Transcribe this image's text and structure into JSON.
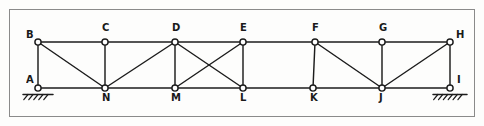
{
  "diagram": {
    "kind": "truss-line-diagram",
    "stroke_color": "#1c1c1c",
    "node_fill_color": "#ffffff",
    "border_color": "#8a8a8a",
    "background_color": "#fdfdfc",
    "canvas": {
      "width": 484,
      "height": 126
    },
    "border": {
      "x": 9,
      "y": 9,
      "width": 465,
      "height": 107
    },
    "chords": {
      "top_y": 42,
      "bottom_y": 88
    },
    "nodes": [
      {
        "id": "A",
        "label": "A",
        "x": 38,
        "y": 88,
        "label_dx": -12,
        "label_dy": -13,
        "support": "pin"
      },
      {
        "id": "B",
        "label": "B",
        "x": 38,
        "y": 42,
        "label_dx": -12,
        "label_dy": -12,
        "support": "none"
      },
      {
        "id": "C",
        "label": "C",
        "x": 105,
        "y": 42,
        "label_dx": -3,
        "label_dy": -19,
        "support": "none"
      },
      {
        "id": "D",
        "label": "D",
        "x": 175,
        "y": 42,
        "label_dx": -3,
        "label_dy": -19,
        "support": "none"
      },
      {
        "id": "E",
        "label": "E",
        "x": 243,
        "y": 42,
        "label_dx": -3,
        "label_dy": -19,
        "support": "none"
      },
      {
        "id": "F",
        "label": "F",
        "x": 315,
        "y": 42,
        "label_dx": -3,
        "label_dy": -19,
        "support": "none"
      },
      {
        "id": "G",
        "label": "G",
        "x": 382,
        "y": 42,
        "label_dx": -3,
        "label_dy": -19,
        "support": "none"
      },
      {
        "id": "H",
        "label": "H",
        "x": 450,
        "y": 42,
        "label_dx": 6,
        "label_dy": -12,
        "support": "none"
      },
      {
        "id": "I",
        "label": "I",
        "x": 450,
        "y": 88,
        "label_dx": 7,
        "label_dy": -13,
        "support": "pin"
      },
      {
        "id": "J",
        "label": "J",
        "x": 382,
        "y": 88,
        "label_dx": -3,
        "label_dy": 5,
        "support": "none"
      },
      {
        "id": "K",
        "label": "K",
        "x": 313,
        "y": 88,
        "label_dx": -3,
        "label_dy": 5,
        "support": "none"
      },
      {
        "id": "L",
        "label": "L",
        "x": 243,
        "y": 88,
        "label_dx": -3,
        "label_dy": 5,
        "support": "none"
      },
      {
        "id": "M",
        "label": "M",
        "x": 175,
        "y": 88,
        "label_dx": -4,
        "label_dy": 5,
        "support": "none"
      },
      {
        "id": "N",
        "label": "N",
        "x": 105,
        "y": 88,
        "label_dx": -3,
        "label_dy": 5,
        "support": "none"
      }
    ],
    "members": [
      {
        "from": "B",
        "to": "C",
        "type": "top-chord"
      },
      {
        "from": "C",
        "to": "D",
        "type": "top-chord"
      },
      {
        "from": "D",
        "to": "E",
        "type": "top-chord"
      },
      {
        "from": "E",
        "to": "F",
        "type": "top-chord"
      },
      {
        "from": "F",
        "to": "G",
        "type": "top-chord"
      },
      {
        "from": "G",
        "to": "H",
        "type": "top-chord"
      },
      {
        "from": "A",
        "to": "N",
        "type": "bottom-chord"
      },
      {
        "from": "N",
        "to": "M",
        "type": "bottom-chord"
      },
      {
        "from": "M",
        "to": "L",
        "type": "bottom-chord"
      },
      {
        "from": "L",
        "to": "K",
        "type": "bottom-chord"
      },
      {
        "from": "K",
        "to": "J",
        "type": "bottom-chord"
      },
      {
        "from": "J",
        "to": "I",
        "type": "bottom-chord"
      },
      {
        "from": "A",
        "to": "B",
        "type": "vertical"
      },
      {
        "from": "C",
        "to": "N",
        "type": "vertical"
      },
      {
        "from": "D",
        "to": "M",
        "type": "vertical"
      },
      {
        "from": "E",
        "to": "L",
        "type": "vertical"
      },
      {
        "from": "F",
        "to": "K",
        "type": "vertical"
      },
      {
        "from": "G",
        "to": "J",
        "type": "vertical"
      },
      {
        "from": "H",
        "to": "I",
        "type": "vertical"
      },
      {
        "from": "B",
        "to": "N",
        "type": "diagonal"
      },
      {
        "from": "N",
        "to": "D",
        "type": "diagonal"
      },
      {
        "from": "D",
        "to": "L",
        "type": "diagonal"
      },
      {
        "from": "E",
        "to": "M",
        "type": "diagonal"
      },
      {
        "from": "F",
        "to": "J",
        "type": "diagonal"
      },
      {
        "from": "J",
        "to": "H",
        "type": "diagonal"
      }
    ],
    "supports": [
      {
        "node": "A",
        "type": "pin",
        "hatch_width": 30,
        "hatch_ticks": 5
      },
      {
        "node": "I",
        "type": "pin",
        "hatch_width": 34,
        "hatch_ticks": 6
      }
    ]
  }
}
